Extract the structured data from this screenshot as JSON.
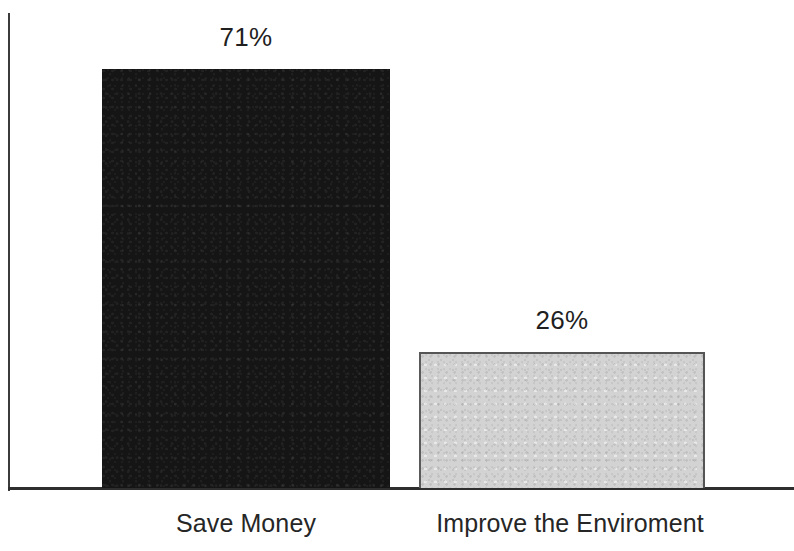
{
  "chart_data": {
    "type": "bar",
    "title": "",
    "subtitle": "",
    "xlabel": "",
    "ylabel": "",
    "categories": [
      "Save Money",
      "Improve the Enviroment"
    ],
    "values": [
      71,
      26
    ],
    "value_labels": [
      "71%",
      "26%"
    ],
    "unit": "%",
    "ylim": [
      0,
      100
    ],
    "grid": false,
    "legend": false,
    "legend_position": "none",
    "axes": {
      "y_axis_visible": true,
      "x_axis_visible": true,
      "y_tick_labels": [],
      "x_tick_labels": []
    },
    "series": [
      {
        "name": "Primary reason",
        "values": [
          71,
          26
        ],
        "colors": [
          "#151515",
          "#d3d3d3"
        ]
      }
    ],
    "colors": {
      "bar_dark": "#151515",
      "bar_light": "#d3d3d3",
      "bar_light_border": "#555555",
      "axis": "#2e2e2e",
      "text": "#1f1f1f",
      "background": "#ffffff"
    }
  },
  "bars": [
    {
      "category": "Save Money",
      "value_label": "71%",
      "value": 71,
      "fill": "#151515"
    },
    {
      "category": "Improve the Enviroment",
      "value_label": "26%",
      "value": 26,
      "fill": "#d3d3d3"
    }
  ]
}
